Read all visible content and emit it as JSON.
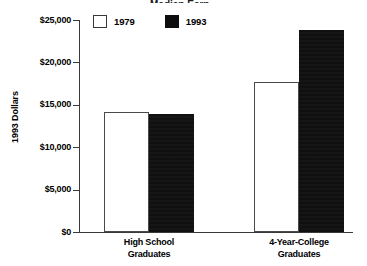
{
  "chart_data": {
    "type": "bar",
    "title": "",
    "xlabel": "",
    "ylabel": "1993 Dollars",
    "categories": [
      "High School Graduates",
      "4-Year-College Graduates"
    ],
    "category_lines": [
      [
        "High School",
        "Graduates"
      ],
      [
        "4-Year-College",
        "Graduates"
      ]
    ],
    "series": [
      {
        "name": "1979",
        "values": [
          14200,
          17700
        ],
        "color": "#ffffff",
        "edge_color": "#4a4a4a"
      },
      {
        "name": "1993",
        "values": [
          13900,
          23800
        ],
        "color": "#101010",
        "edge_color": "#101010"
      }
    ],
    "ylim": [
      0,
      25000
    ],
    "yticks": [
      0,
      5000,
      10000,
      15000,
      20000,
      25000
    ],
    "ytick_labels": [
      "$0",
      "$5,000",
      "$10,000",
      "$15,000",
      "$20,000",
      "$25,000"
    ],
    "grid": false,
    "legend_position": "upper left",
    "legend_entries": [
      "1979",
      "1993"
    ]
  },
  "axis": {
    "y_title": "1993 Dollars"
  },
  "legend": {
    "items": [
      {
        "label": "1979",
        "swatch": "open-square-swatch"
      },
      {
        "label": "1993",
        "swatch": "filled-square-swatch"
      }
    ]
  },
  "title_remnant": "Median Earnings"
}
